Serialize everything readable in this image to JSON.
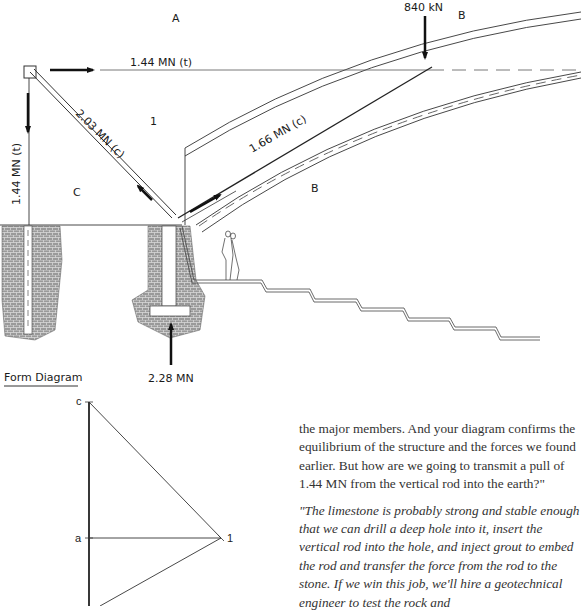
{
  "form_diagram": {
    "caption": "Form Diagram",
    "space_labels": {
      "A": "A",
      "B_top": "B",
      "B_lower": "B",
      "C": "C",
      "node_1": "1"
    },
    "forces": {
      "top_horizontal": "1.44 MN (t)",
      "left_vertical": "1.44 MN (t)",
      "diagonal_strut": "2.03 MN (c)",
      "arch_strut": "1.66 MN (c)",
      "applied_load": "840 kN",
      "reaction": "2.28 MN"
    }
  },
  "force_diagram": {
    "points": {
      "c": "c",
      "a": "a",
      "one": "1"
    }
  },
  "body_text": {
    "paragraph_1": "the major members. And your diagram confirms the equilibrium of the structure and the forces we found earlier. But how are we going to transmit a pull of 1.44 MN from the vertical rod into the earth?\"",
    "paragraph_2": "\"The limestone is probably strong and stable enough that we can drill a deep hole into it, insert the vertical rod into the hole, and inject grout to embed the rod and transfer the force from the rod to the stone. If we win this job, we'll hire a geotechnical engineer to test the rock and"
  }
}
